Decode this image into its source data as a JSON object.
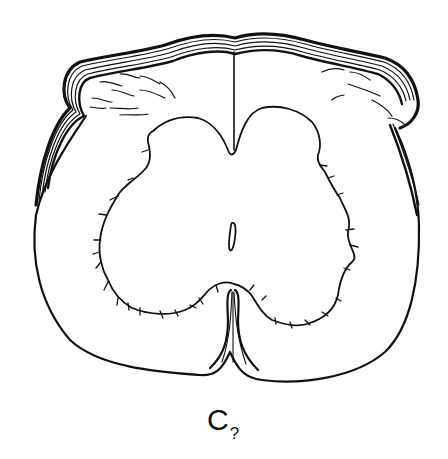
{
  "figure": {
    "style": "black line drawing on white",
    "colors": {
      "background": "#ffffff",
      "line": "#111111"
    },
    "label": {
      "main": "C",
      "subscript": "?"
    }
  }
}
